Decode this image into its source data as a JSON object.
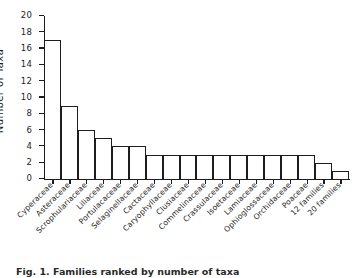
{
  "chart_data": {
    "type": "bar",
    "title": "",
    "xlabel": "",
    "ylabel": "Number of Taxa",
    "ylim": [
      0,
      20
    ],
    "yticks": [
      0,
      2,
      4,
      6,
      8,
      10,
      12,
      14,
      16,
      18,
      20
    ],
    "ytick_labels": [
      "0",
      "2",
      "4",
      "6",
      "8",
      "10",
      "12",
      "14",
      "16",
      "18",
      "20"
    ],
    "grid": false,
    "legend": null,
    "bar_edge_color": "#1d1d1d",
    "bar_fill_color": "#ffffff",
    "categories": [
      "Cyperaceae",
      "Asteraceae",
      "Scrophulariaceae",
      "Liliaceae",
      "Portulacaceae",
      "Selaginellaceae",
      "Cactaceae",
      "Caryophyllaceae",
      "Clusiaceae",
      "Commelinaceae",
      "Crassulaceae",
      "Isoetaceae",
      "Lamiaceae",
      "Ophioglossaceae",
      "Orchidaceae",
      "Poaceae",
      "12 families",
      "20 families"
    ],
    "values": [
      17,
      9,
      6,
      5,
      4,
      4,
      3,
      3,
      3,
      3,
      3,
      3,
      3,
      3,
      3,
      3,
      2,
      1
    ]
  },
  "caption": {
    "text": "Fig. 1. Families ranked by number of taxa"
  }
}
